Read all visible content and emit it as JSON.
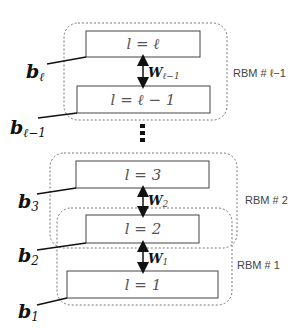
{
  "diagram": {
    "layers": {
      "top": {
        "label": "l = ℓ"
      },
      "top_minus_1": {
        "label": "l = ℓ − 1"
      },
      "l3": {
        "label": "l = 3"
      },
      "l2": {
        "label": "l = 2"
      },
      "l1": {
        "label": "l = 1"
      }
    },
    "biases": {
      "top": {
        "base": "b",
        "sub": "ℓ"
      },
      "top_minus_1": {
        "base": "b",
        "sub": "ℓ−1"
      },
      "l3": {
        "base": "b",
        "sub": "3"
      },
      "l2": {
        "base": "b",
        "sub": "2"
      },
      "l1": {
        "base": "b",
        "sub": "1"
      }
    },
    "weights": {
      "top": {
        "base": "W",
        "sub": "ℓ−1"
      },
      "w2": {
        "base": "W",
        "sub": "2"
      },
      "w1": {
        "base": "W",
        "sub": "1"
      }
    },
    "rbms": {
      "top": "RBM # ℓ−1",
      "r2": "RBM # 2",
      "r1": "RBM # 1"
    },
    "ellipsis": "⋮"
  }
}
